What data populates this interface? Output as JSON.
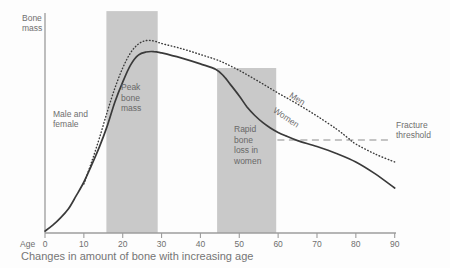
{
  "caption": "Changes in amount of bone with increasing age",
  "labels": {
    "y_axis": [
      "Bone",
      "mass"
    ],
    "male_female": [
      "Male and",
      "female"
    ],
    "peak_band": [
      "Peak",
      "bone",
      "mass"
    ],
    "rapid_band": [
      "Rapid",
      "bone",
      "loss in",
      "women"
    ],
    "men": "Men",
    "women": "Women",
    "fracture_threshold": [
      "Fracture",
      "threshold"
    ],
    "age": "Age"
  },
  "colors": {
    "band": "#c9c9c9",
    "curve": "#3a3a3a",
    "axis": "#9c9c9c",
    "text": "#6f6f6f",
    "threshold": "#8c8c8c"
  },
  "chart_data": {
    "type": "line",
    "title": "Changes in amount of bone with increasing age",
    "xlabel": "Age",
    "ylabel": "Bone mass",
    "x_range": [
      0,
      90
    ],
    "x_ticks": [
      0,
      10,
      20,
      30,
      40,
      50,
      60,
      70,
      80,
      90
    ],
    "y_unit": "relative bone mass (% of peak male bone mass, unlabeled axis)",
    "grid": false,
    "series": [
      {
        "name": "Male and female / Women",
        "key": "women",
        "style": "solid",
        "points": [
          [
            0,
            1
          ],
          [
            2,
            4.1
          ],
          [
            4,
            7.8
          ],
          [
            6,
            12.4
          ],
          [
            8,
            19.2
          ],
          [
            10,
            26.4
          ],
          [
            12,
            35.2
          ],
          [
            14,
            44.6
          ],
          [
            16,
            55.4
          ],
          [
            18,
            67.9
          ],
          [
            20,
            78.2
          ],
          [
            22,
            87
          ],
          [
            24,
            92.2
          ],
          [
            26,
            93.8
          ],
          [
            28,
            94
          ],
          [
            30,
            93.3
          ],
          [
            35,
            90.7
          ],
          [
            40,
            87.6
          ],
          [
            44,
            84.7
          ],
          [
            46,
            81.3
          ],
          [
            48,
            76.2
          ],
          [
            50,
            71
          ],
          [
            52,
            65.3
          ],
          [
            54,
            60.9
          ],
          [
            56,
            57.3
          ],
          [
            58,
            54.4
          ],
          [
            60,
            52.1
          ],
          [
            62,
            50.3
          ],
          [
            65,
            47.9
          ],
          [
            70,
            44.8
          ],
          [
            75,
            41.2
          ],
          [
            80,
            36.8
          ],
          [
            85,
            30.6
          ],
          [
            90,
            23.3
          ]
        ]
      },
      {
        "name": "Men",
        "key": "men",
        "style": "dotted",
        "points": [
          [
            10,
            25.4
          ],
          [
            12,
            36.8
          ],
          [
            14,
            49.2
          ],
          [
            16,
            62.7
          ],
          [
            18,
            75.1
          ],
          [
            20,
            85.5
          ],
          [
            22,
            93.3
          ],
          [
            24,
            97.9
          ],
          [
            26,
            99.7
          ],
          [
            28,
            99.5
          ],
          [
            30,
            98.2
          ],
          [
            35,
            95.6
          ],
          [
            40,
            92.5
          ],
          [
            45,
            89.1
          ],
          [
            50,
            84.2
          ],
          [
            55,
            78.5
          ],
          [
            60,
            72.5
          ],
          [
            65,
            66.8
          ],
          [
            70,
            60.6
          ],
          [
            75,
            53.9
          ],
          [
            78,
            49.2
          ],
          [
            80,
            46.1
          ],
          [
            85,
            40.9
          ],
          [
            90,
            36.8
          ]
        ]
      }
    ],
    "threshold": {
      "label": "Fracture threshold",
      "value": 48.2,
      "from_age": 59.8,
      "to_age": 89.4
    },
    "bands": [
      {
        "label": "Peak bone mass",
        "key": "peak-bone-mass-band",
        "from_age": 15.8,
        "to_age": 29,
        "top_value": 115
      },
      {
        "label": "Rapid bone loss in women",
        "key": "rapid-bone-loss-band",
        "from_age": 44.3,
        "to_age": 59.5,
        "top_value": 85.5
      }
    ]
  }
}
